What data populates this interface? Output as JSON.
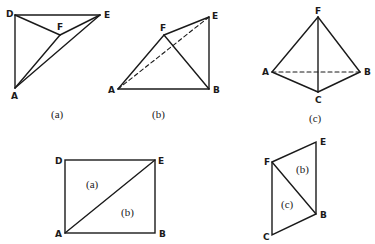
{
  "colors": {
    "stroke": "#1a1a1a",
    "background": "#ffffff"
  },
  "figures": {
    "a": {
      "caption": "(a)",
      "vertices": {
        "D": "D",
        "E": "E",
        "F": "F",
        "A": "A"
      }
    },
    "b": {
      "caption": "(b)",
      "vertices": {
        "A": "A",
        "F": "F",
        "E": "E",
        "B": "B"
      }
    },
    "c": {
      "caption": "(c)",
      "vertices": {
        "F": "F",
        "A": "A",
        "B": "B",
        "C": "C"
      }
    },
    "net_rect": {
      "vertices": {
        "D": "D",
        "E": "E",
        "A": "A",
        "B": "B"
      },
      "faces": {
        "upper": "(a)",
        "lower": "(b)"
      }
    },
    "net_para": {
      "vertices": {
        "F": "F",
        "E": "E",
        "B": "B",
        "C": "C"
      },
      "faces": {
        "upper": "(b)",
        "lower": "(c)"
      }
    }
  }
}
